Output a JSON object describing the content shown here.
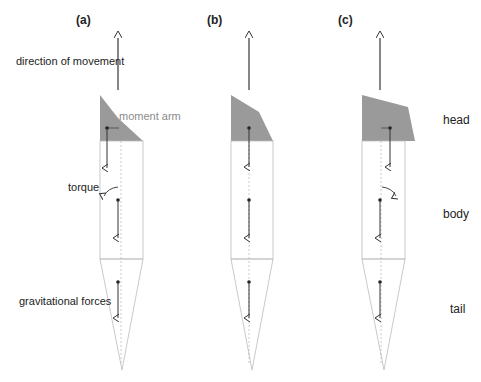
{
  "panels": [
    {
      "id": "a",
      "label": "(a)"
    },
    {
      "id": "b",
      "label": "(b)"
    },
    {
      "id": "c",
      "label": "(c)"
    }
  ],
  "annotations": {
    "direction": "direction of movement",
    "moment_arm": "moment arm",
    "torque": "torque",
    "gravitational": "gravitational forces"
  },
  "segments": {
    "head": "head",
    "body": "body",
    "tail": "tail"
  },
  "colors": {
    "head_fill": "#9a9a9a",
    "outline": "#b0b0b0",
    "arrow": "#333333",
    "moment_arm_text": "#8a8a8a"
  }
}
